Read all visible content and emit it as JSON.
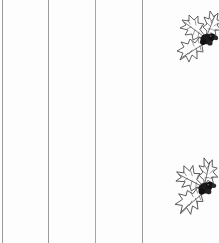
{
  "page": {
    "title": "Holly Stationery Sheet",
    "width": 219,
    "height": 243,
    "background_color": "#fdfdfd"
  },
  "rules": {
    "name": "vertical-rule-lines",
    "count": 4,
    "color": "#9a9a9a",
    "thickness_px": 1,
    "orientation": "vertical",
    "full_height": true,
    "positions_px": [
      2,
      48,
      95,
      142
    ]
  },
  "decorations": {
    "name": "holly-sprigs",
    "ink_color": "#3a3a3a",
    "berry_color": "#1a1a1a",
    "items": [
      {
        "id": "holly-top",
        "label": "Holly sprig top right",
        "leaf_count": 3,
        "berry_cluster": true,
        "x_px": 166,
        "y_px": 2,
        "width_px": 56,
        "height_px": 88,
        "rotation_deg": 0
      },
      {
        "id": "holly-bottom",
        "label": "Holly sprig bottom right",
        "leaf_count": 3,
        "berry_cluster": true,
        "x_px": 162,
        "y_px": 145,
        "width_px": 58,
        "height_px": 86,
        "rotation_deg": -8
      }
    ]
  },
  "a11y": {
    "page_role": "Scanned decorative stationery page",
    "holly_top_alt": "Holly leaf sprig with berries, upper right",
    "holly_bottom_alt": "Holly leaf sprig with berries, lower right"
  }
}
